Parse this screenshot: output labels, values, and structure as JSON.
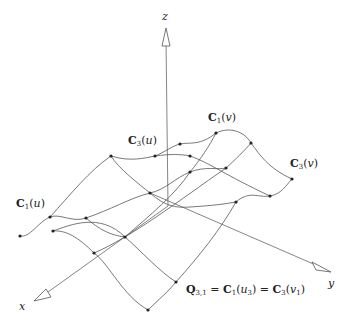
{
  "figure": {
    "axes": {
      "x_label": "x",
      "y_label": "y",
      "z_label": "z"
    },
    "curve_labels": {
      "c1u": {
        "bold": "C",
        "sub": "1",
        "arg": "u"
      },
      "c3u": {
        "bold": "C",
        "sub": "3",
        "arg": "u"
      },
      "c1v": {
        "bold": "C",
        "sub": "1",
        "arg": "v"
      },
      "c3v": {
        "bold": "C",
        "sub": "3",
        "arg": "v"
      }
    },
    "annotation": {
      "q_bold": "Q",
      "q_sub": "3,1",
      "eq1": " = ",
      "c1_bold": "C",
      "c1_sub": "1",
      "c1_arg_var": "u",
      "c1_arg_sub": "3",
      "eq2": " = ",
      "c3_bold": "C",
      "c3_sub": "3",
      "c3_arg_var": "v",
      "c3_arg_sub": "1"
    },
    "colors": {
      "stroke": "#555555",
      "point": "#222222"
    }
  }
}
